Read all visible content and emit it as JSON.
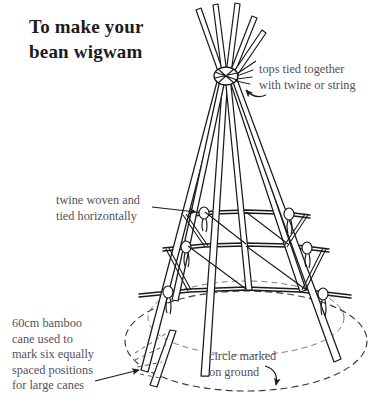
{
  "figure": {
    "title_line1": "To make your",
    "title_line2": "bean wigwam",
    "background_color": "#ffffff",
    "ink_color": "#1a1a1a",
    "label_color": "#565156"
  },
  "annotations": {
    "tops": {
      "line1": "tops tied together",
      "line2": "with twine or string"
    },
    "twine": {
      "line1": "twine woven and",
      "line2": "tied horizontally"
    },
    "bamboo": {
      "line1": "60cm bamboo",
      "line2": "cane used to",
      "line3": "mark six equally",
      "line4": "spaced positions",
      "line5": "for large canes"
    },
    "circle": {
      "line1": "circle marked",
      "line2": "on ground"
    }
  },
  "diagram": {
    "apex_x": 225,
    "apex_y": 76,
    "base_center_x": 246,
    "base_center_y": 341,
    "base_radius_x": 121,
    "base_radius_y": 50,
    "cane_count": 6,
    "twine_ring_count": 3,
    "ground_circle_style": "dashed"
  }
}
